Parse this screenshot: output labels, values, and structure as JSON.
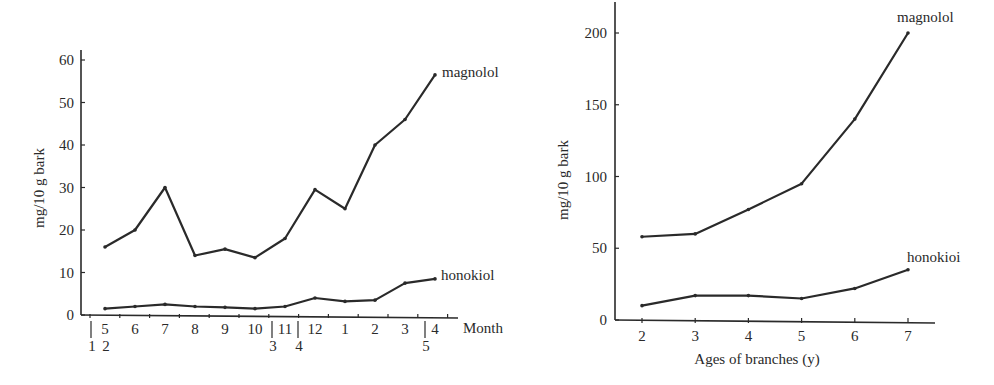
{
  "chart_data": [
    {
      "type": "line",
      "title": "",
      "xlabel": "Month",
      "ylabel": "mg/10 g bark",
      "ylim": [
        0,
        60
      ],
      "yticks": [
        0,
        10,
        20,
        30,
        40,
        50,
        60
      ],
      "categories": [
        "5",
        "6",
        "7",
        "8",
        "9",
        "10",
        "11",
        "12",
        "1",
        "2",
        "3",
        "4"
      ],
      "secondary_tick_labels": [
        {
          "label": "1",
          "position": "before 5"
        },
        {
          "label": "2",
          "position": "under 5"
        },
        {
          "label": "3",
          "position": "between 10 and 11"
        },
        {
          "label": "4",
          "position": "between 11 and 12"
        },
        {
          "label": "5",
          "position": "before 4"
        }
      ],
      "series": [
        {
          "name": "magnolol",
          "values": [
            16,
            20,
            30,
            14,
            15.5,
            13.5,
            18,
            29.5,
            25,
            40,
            46,
            56.5
          ]
        },
        {
          "name": "honokiol",
          "values": [
            1.5,
            2,
            2.5,
            2,
            1.8,
            1.5,
            2,
            4,
            3.2,
            3.5,
            7.5,
            8.5
          ]
        }
      ],
      "grid": false,
      "legend_position": "inline labels at line ends"
    },
    {
      "type": "line",
      "title": "",
      "xlabel": "Ages of branches (y)",
      "ylabel": "mg/10 g bark",
      "ylim": [
        0,
        220
      ],
      "yticks": [
        0,
        50,
        100,
        150,
        200
      ],
      "categories": [
        "2",
        "3",
        "4",
        "5",
        "6",
        "7"
      ],
      "series": [
        {
          "name": "magnolol",
          "values": [
            58,
            60,
            77,
            95,
            140,
            200
          ]
        },
        {
          "name": "honokioi",
          "values": [
            10,
            17,
            17,
            15,
            22,
            35
          ]
        }
      ],
      "grid": false,
      "legend_position": "inline labels at line ends"
    }
  ],
  "left": {
    "ylabel": "mg/10 g bark",
    "xlabel": "Month",
    "yticks": [
      "0",
      "10",
      "20",
      "30",
      "40",
      "50",
      "60"
    ],
    "months": [
      "5",
      "6",
      "7",
      "8",
      "9",
      "10",
      "11",
      "12",
      "1",
      "2",
      "3",
      "4"
    ],
    "sub": [
      "1",
      "2",
      "3",
      "4",
      "5"
    ],
    "series_labels": {
      "magnolol": "magnolol",
      "honokiol": "honokiol"
    }
  },
  "right": {
    "ylabel": "mg/10 g bark",
    "xlabel": "Ages of branches (y)",
    "yticks": [
      "0",
      "50",
      "100",
      "150",
      "200"
    ],
    "ages": [
      "2",
      "3",
      "4",
      "5",
      "6",
      "7"
    ],
    "series_labels": {
      "magnolol": "magnolol",
      "honokiol": "honokioi"
    }
  }
}
